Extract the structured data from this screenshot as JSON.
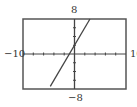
{
  "chart_data": {
    "type": "line",
    "title": "",
    "xlabel": "",
    "ylabel": "",
    "xlim": [
      -10,
      10
    ],
    "ylim": [
      -8,
      8
    ],
    "xscale": 2,
    "yscale": 2,
    "grid": false,
    "window_labels": {
      "xmin": "−10",
      "xmax": "10",
      "ymin": "−8",
      "ymax": "8"
    },
    "series": [
      {
        "name": "y = 2x + 2",
        "equation": "y = 2x + 2",
        "x": [
          -4.7,
          3
        ],
        "y": [
          -7.4,
          8
        ]
      }
    ]
  },
  "style": {
    "frame_color": "#555555",
    "axis_color": "#444444",
    "line_color": "#444444"
  }
}
